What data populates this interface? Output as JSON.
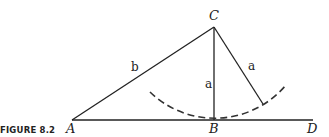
{
  "figure": {
    "caption": "FIGURE 8.2",
    "points": {
      "A": {
        "label": "A",
        "x": 72,
        "y": 120
      },
      "B": {
        "label": "B",
        "x": 214,
        "y": 120
      },
      "C": {
        "label": "C",
        "x": 214,
        "y": 27
      },
      "D": {
        "label": "D",
        "x": 313,
        "y": 120
      },
      "E": {
        "x": 263,
        "y": 104
      }
    },
    "sides": {
      "AC": "b",
      "CB": "a",
      "CE": "a"
    },
    "arc": {
      "center": "C",
      "radius": 93,
      "style": "dashed"
    },
    "colors": {
      "stroke": "#222222",
      "background": "#ffffff"
    }
  }
}
